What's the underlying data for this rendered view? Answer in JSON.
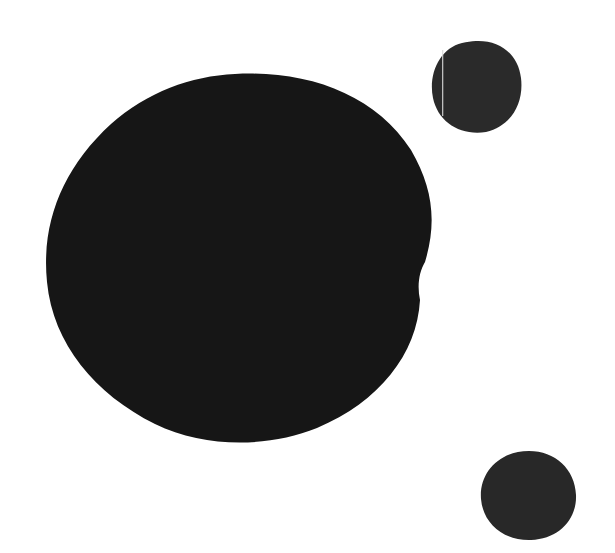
{
  "canvas": {
    "width": 615,
    "height": 553,
    "background": "#ffffff"
  },
  "shapes": [
    {
      "name": "large-ink-blob",
      "fill": "#161616",
      "bbox": {
        "x": 45,
        "y": 72,
        "w": 388,
        "h": 372
      }
    },
    {
      "name": "small-ink-blob-top-right",
      "fill": "#2a2a2a",
      "bbox": {
        "x": 430,
        "y": 40,
        "w": 93,
        "h": 94
      },
      "streak_color": "#d8d8d8"
    },
    {
      "name": "small-ink-blob-bottom-right",
      "fill": "#282828",
      "bbox": {
        "x": 479,
        "y": 449,
        "w": 98,
        "h": 92
      }
    }
  ]
}
